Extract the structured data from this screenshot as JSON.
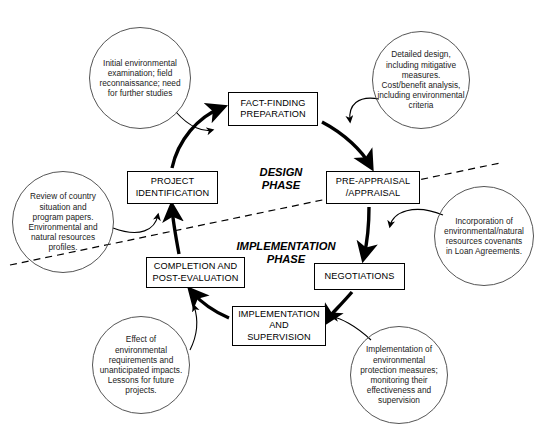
{
  "diagram": {
    "stages": [
      {
        "id": "fact-finding-preparation",
        "label": "FACT-FINDING\nPREPARATION",
        "x": 228,
        "y": 92,
        "w": 90,
        "h": 34
      },
      {
        "id": "pre-appraisal-appraisal",
        "label": "PRE-APPRAISAL\n/APPRAISAL",
        "x": 326,
        "y": 171,
        "w": 94,
        "h": 33
      },
      {
        "id": "negotiations",
        "label": "NEGOTIATIONS",
        "x": 314,
        "y": 263,
        "w": 91,
        "h": 27
      },
      {
        "id": "implementation-and-supervision",
        "label": "IMPLEMENTATION\nAND\nSUPERVISION",
        "x": 232,
        "y": 306,
        "w": 94,
        "h": 40
      },
      {
        "id": "completion-and-post-evaluation",
        "label": "COMPLETION AND\nPOST-EVALUATION",
        "x": 146,
        "y": 257,
        "w": 99,
        "h": 31
      },
      {
        "id": "project-identification",
        "label": "PROJECT\nIDENTIFICATION",
        "x": 127,
        "y": 171,
        "w": 91,
        "h": 33
      }
    ],
    "phases": [
      {
        "id": "design-phase",
        "label": "DESIGN\nPHASE",
        "x": 236,
        "y": 152,
        "w": 90
      },
      {
        "id": "implementation-phase",
        "label": "IMPLEMENTATION\nPHASE",
        "x": 216,
        "y": 226,
        "w": 140
      }
    ],
    "bubbles": [
      {
        "id": "initial-environmental-examination",
        "text": "Initial environmental\nexamination; field\nreconnaissance; need\nfor further studies",
        "cx": 140,
        "cy": 78,
        "r": 51
      },
      {
        "id": "detailed-design",
        "text": "Detailed design,\nincluding mitigative\nmeasures.\nCost/benefit analysis,\nincluding environmental\ncriteria",
        "cx": 421,
        "cy": 80,
        "r": 49
      },
      {
        "id": "incorporation-of-covenants",
        "text": "Incorporation of\nenvironmental/natural\nresources covenants\nin Loan Agreements.",
        "cx": 484,
        "cy": 236,
        "r": 50
      },
      {
        "id": "implementation-of-protection-measures",
        "text": "Implementation of\nenvironmental\nprotection measures;\nmonitoring their\neffectiveness and\nsupervision",
        "cx": 399,
        "cy": 375,
        "r": 49
      },
      {
        "id": "effect-of-environmental-requirements",
        "text": "Effect of\nenvironmental\nrequirements and\nunanticipated impacts.\nLessons for future\nprojects.",
        "cx": 141,
        "cy": 365,
        "r": 49
      },
      {
        "id": "review-of-country-situation",
        "text": "Review of country\nsituation and\nprogram papers.\nEnvironmental and\nnatural resources\nprofiles.",
        "cx": 63,
        "cy": 222,
        "r": 51
      }
    ],
    "colors": {
      "stroke": "#000000",
      "bubble_stroke": "#555555",
      "background": "#ffffff",
      "divider": "#000000"
    },
    "divider": {
      "id": "phase-divider",
      "style": "dashed",
      "x1": 10,
      "y1": 265,
      "x2": 500,
      "y2": 163
    }
  }
}
